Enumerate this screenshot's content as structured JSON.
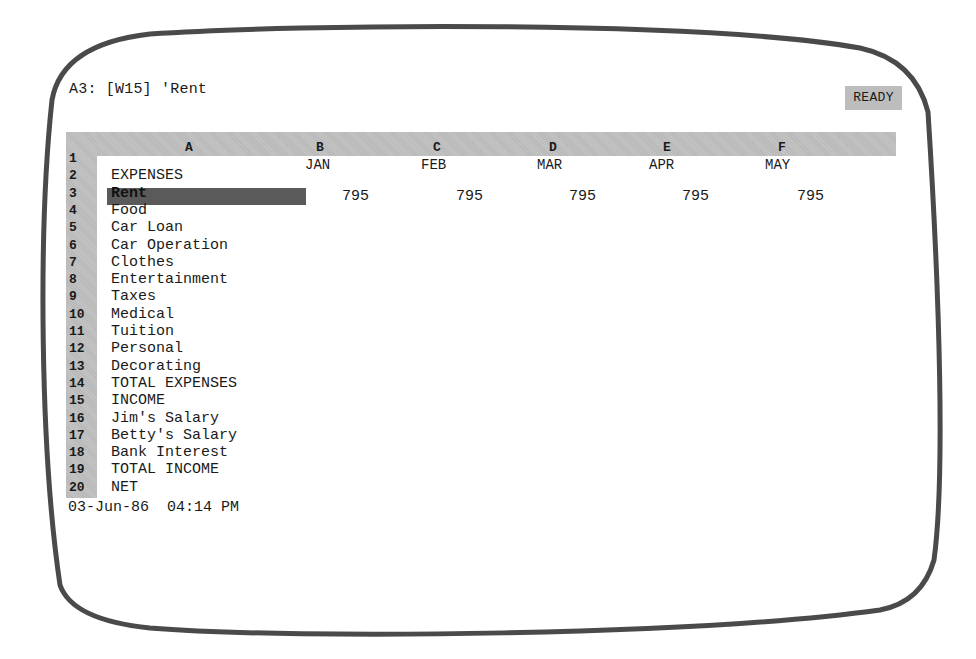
{
  "control_panel": {
    "cell_address": "A3:",
    "format": "[W15]",
    "contents": "'Rent",
    "mode": "READY"
  },
  "columns": [
    {
      "letter": "A",
      "x": 189
    },
    {
      "letter": "B",
      "x": 320
    },
    {
      "letter": "C",
      "x": 437
    },
    {
      "letter": "D",
      "x": 553
    },
    {
      "letter": "E",
      "x": 667
    },
    {
      "letter": "F",
      "x": 782
    }
  ],
  "months": [
    {
      "label": "JAN",
      "x": 305
    },
    {
      "label": "FEB",
      "x": 421
    },
    {
      "label": "MAR",
      "x": 537
    },
    {
      "label": "APR",
      "x": 649
    },
    {
      "label": "MAY",
      "x": 765
    }
  ],
  "rows": [
    {
      "num": "1",
      "label": ""
    },
    {
      "num": "2",
      "label": "EXPENSES"
    },
    {
      "num": "3",
      "label": "Rent"
    },
    {
      "num": "4",
      "label": "Food"
    },
    {
      "num": "5",
      "label": "Car Loan"
    },
    {
      "num": "6",
      "label": "Car Operation"
    },
    {
      "num": "7",
      "label": "Clothes"
    },
    {
      "num": "8",
      "label": "Entertainment"
    },
    {
      "num": "9",
      "label": "Taxes"
    },
    {
      "num": "10",
      "label": "Medical"
    },
    {
      "num": "11",
      "label": "Tuition"
    },
    {
      "num": "12",
      "label": "Personal"
    },
    {
      "num": "13",
      "label": "Decorating"
    },
    {
      "num": "14",
      "label": "TOTAL EXPENSES"
    },
    {
      "num": "15",
      "label": "INCOME"
    },
    {
      "num": "16",
      "label": "Jim's Salary"
    },
    {
      "num": "17",
      "label": "Betty's Salary"
    },
    {
      "num": "18",
      "label": "Bank Interest"
    },
    {
      "num": "19",
      "label": "TOTAL INCOME"
    },
    {
      "num": "20",
      "label": "NET"
    }
  ],
  "rent_values": [
    {
      "column": "B",
      "value": "795",
      "x": 342
    },
    {
      "column": "C",
      "value": "795",
      "x": 456
    },
    {
      "column": "D",
      "value": "795",
      "x": 569
    },
    {
      "column": "E",
      "value": "795",
      "x": 682
    },
    {
      "column": "F",
      "value": "795",
      "x": 797
    }
  ],
  "active_cell": "A3",
  "status": {
    "date": "03-Jun-86",
    "time": "04:14 PM"
  },
  "colors": {
    "header_bar": "#bdbdbd",
    "cell_pointer": "#5a5a5a",
    "text": "#1a1a1a",
    "frame": "#4a4a4a"
  }
}
